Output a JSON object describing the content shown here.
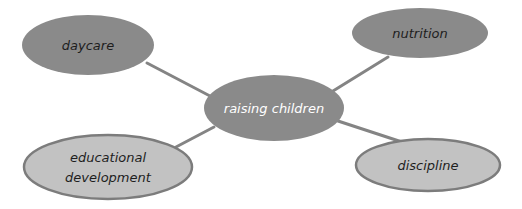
{
  "diagram": {
    "type": "mind-map",
    "colors": {
      "background": "#ffffff",
      "dark_fill": "#8a8a8a",
      "light_fill": "#c2c2c2",
      "light_stroke": "#7c7c7c",
      "connector": "#848484",
      "dark_text": "#1e1e1e",
      "light_text": "#ffffff"
    },
    "center": {
      "id": "raising-children",
      "label": "raising children",
      "cx": 274,
      "cy": 108,
      "rx": 70,
      "ry": 33,
      "style": "dark"
    },
    "nodes": [
      {
        "id": "daycare",
        "lines": [
          "daycare"
        ],
        "cx": 88,
        "cy": 45,
        "rx": 66,
        "ry": 30,
        "style": "dark",
        "connector": {
          "x1": 147,
          "y1": 63,
          "x2": 210,
          "y2": 96
        }
      },
      {
        "id": "nutrition",
        "lines": [
          "nutrition"
        ],
        "cx": 420,
        "cy": 33,
        "rx": 68,
        "ry": 25,
        "style": "dark",
        "connector": {
          "x1": 388,
          "y1": 57,
          "x2": 333,
          "y2": 91
        }
      },
      {
        "id": "educational-development",
        "lines": [
          "educational",
          "development"
        ],
        "cx": 108,
        "cy": 167,
        "rx": 84,
        "ry": 32,
        "style": "light",
        "connector": {
          "x1": 176,
          "y1": 147,
          "x2": 214,
          "y2": 127
        }
      },
      {
        "id": "discipline",
        "lines": [
          "discipline"
        ],
        "cx": 428,
        "cy": 165,
        "rx": 72,
        "ry": 26,
        "style": "light",
        "connector": {
          "x1": 338,
          "y1": 121,
          "x2": 402,
          "y2": 142
        }
      }
    ]
  }
}
